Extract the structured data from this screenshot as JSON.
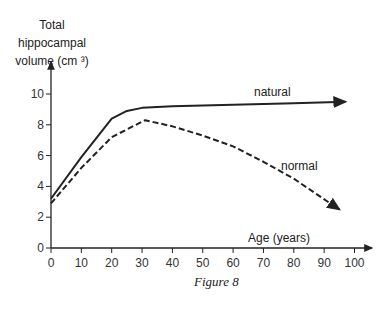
{
  "chart_data": {
    "type": "line",
    "title": "",
    "caption": "Figure 8",
    "xlabel": "Age (years)",
    "ylabel_lines": [
      "Total",
      "hippocampal",
      "volume (cm ³)"
    ],
    "xlim": [
      0,
      105
    ],
    "ylim": [
      0,
      11.5
    ],
    "xticks": [
      0,
      10,
      20,
      30,
      40,
      50,
      60,
      70,
      80,
      90,
      100
    ],
    "yticks": [
      0,
      2,
      4,
      6,
      8,
      10
    ],
    "grid": false,
    "series": [
      {
        "name": "natural",
        "style": "solid",
        "x": [
          0,
          10,
          20,
          25,
          30,
          40,
          60,
          80,
          97
        ],
        "y": [
          3.2,
          5.9,
          8.4,
          8.9,
          9.1,
          9.2,
          9.3,
          9.4,
          9.5
        ]
      },
      {
        "name": "normal",
        "style": "dashed",
        "x": [
          0,
          10,
          20,
          30,
          31,
          40,
          50,
          60,
          70,
          80,
          95
        ],
        "y": [
          2.9,
          5.2,
          7.2,
          8.2,
          8.3,
          7.9,
          7.3,
          6.6,
          5.6,
          4.5,
          2.5
        ]
      }
    ]
  },
  "labels": {
    "ylabel_1": "Total",
    "ylabel_2": "hippocampal",
    "ylabel_3": "volume (cm ³)",
    "xlabel": "Age (years)",
    "natural": "natural",
    "normal": "normal",
    "caption": "Figure 8"
  }
}
